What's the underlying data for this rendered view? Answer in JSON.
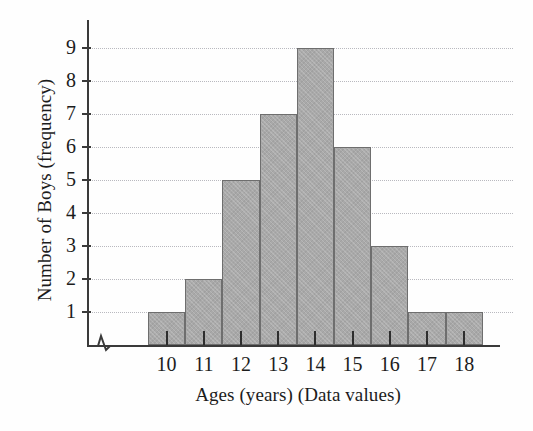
{
  "chart_data": {
    "type": "bar",
    "title": "",
    "xlabel": "Ages (years) (Data values)",
    "ylabel": "Number of Boys (frequency)",
    "categories": [
      "10",
      "11",
      "12",
      "13",
      "14",
      "15",
      "16",
      "17",
      "18"
    ],
    "values": [
      1,
      2,
      5,
      7,
      9,
      6,
      3,
      1,
      1
    ],
    "ylim": [
      0,
      9
    ],
    "yticks": [
      1,
      2,
      3,
      4,
      5,
      6,
      7,
      8,
      9
    ],
    "ytick_labels": [
      "1",
      "2",
      "3",
      "4",
      "5",
      "6",
      "7",
      "8",
      "9"
    ],
    "xlim": [
      "9.5",
      "18.5"
    ],
    "grid": true,
    "grid_style": "dotted-horizontal",
    "legend": null,
    "axis_break": "y-axis-origin-break",
    "bar_fill_color": "#a9a9a9",
    "bar_edge_color": "#6e6e6e",
    "grid_color": "#b9b9bf",
    "axis_color": "#3a3a3a",
    "background_color": "#fefefe",
    "text_color": "#1c1c1c"
  },
  "axes": {
    "y_title": "Number of Boys (frequency)",
    "x_title": "Ages (years) (Data values)"
  }
}
